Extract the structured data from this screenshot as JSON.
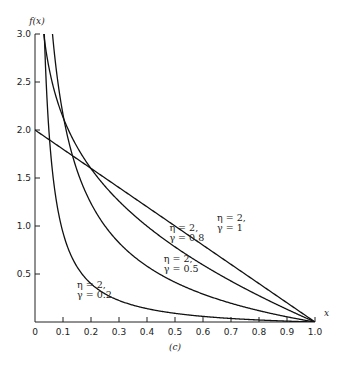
{
  "chart_data": {
    "type": "line",
    "title": "",
    "xlabel": "x",
    "ylabel": "f(x)",
    "caption": "(c)",
    "xlim": [
      0,
      1.0
    ],
    "ylim": [
      0,
      3.0
    ],
    "xticks": [
      "0",
      "0.1",
      "0.2",
      "0.3",
      "0.4",
      "0.5",
      "0.6",
      "0.7",
      "0.8",
      "0.9",
      "1.0"
    ],
    "yticks": [
      "0.5",
      "1.0",
      "1.5",
      "2.0",
      "2.5",
      "3.0"
    ],
    "grid": false,
    "series": [
      {
        "name": "η = 2, γ = 1",
        "eta": 2,
        "gamma": 1,
        "label_lines": [
          "η = 2,",
          "γ = 1"
        ]
      },
      {
        "name": "η = 2, γ = 0.8",
        "eta": 2,
        "gamma": 0.8,
        "label_lines": [
          "η = 2,",
          "γ = 0.8"
        ]
      },
      {
        "name": "η = 2, γ = 0.5",
        "eta": 2,
        "gamma": 0.5,
        "label_lines": [
          "η = 2,",
          "γ = 0.5"
        ]
      },
      {
        "name": "η = 2, γ = 0.2",
        "eta": 2,
        "gamma": 0.2,
        "label_lines": [
          "η = 2,",
          "γ = 0.2"
        ]
      }
    ]
  }
}
